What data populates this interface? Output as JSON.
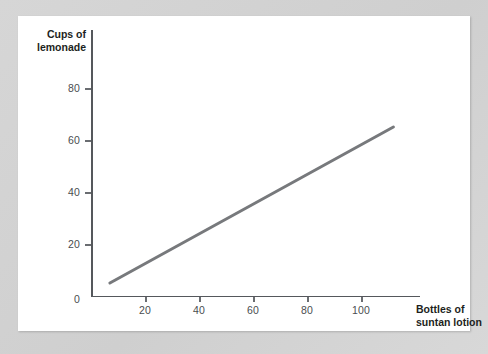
{
  "card": {
    "background_color": "#ffffff",
    "page_background_color": "#d3d3d3"
  },
  "chart_data": {
    "type": "line",
    "title": "",
    "xlabel": "Bottles of suntan lotion",
    "ylabel": "Cups of lemonade",
    "ylabel_lines": [
      "Cups of",
      "lemonade"
    ],
    "xlabel_lines": [
      "Bottles of",
      "suntan lotion"
    ],
    "xlim": [
      0,
      122
    ],
    "ylim": [
      0,
      88
    ],
    "xticks": [
      20,
      40,
      60,
      80,
      100
    ],
    "yticks": [
      0,
      20,
      40,
      60,
      80
    ],
    "xtick_labels": [
      "20",
      "40",
      "60",
      "80",
      "100"
    ],
    "ytick_labels": [
      "0",
      "20",
      "40",
      "60",
      "80"
    ],
    "grid": false,
    "legend": false,
    "series": [
      {
        "name": "Lemonade vs suntan lotion",
        "color": "#77797c",
        "line_width": 3,
        "x": [
          7,
          112
        ],
        "y": [
          5,
          65
        ],
        "points": [
          {
            "x": 7,
            "y": 5
          },
          {
            "x": 112,
            "y": 65
          }
        ]
      }
    ]
  }
}
